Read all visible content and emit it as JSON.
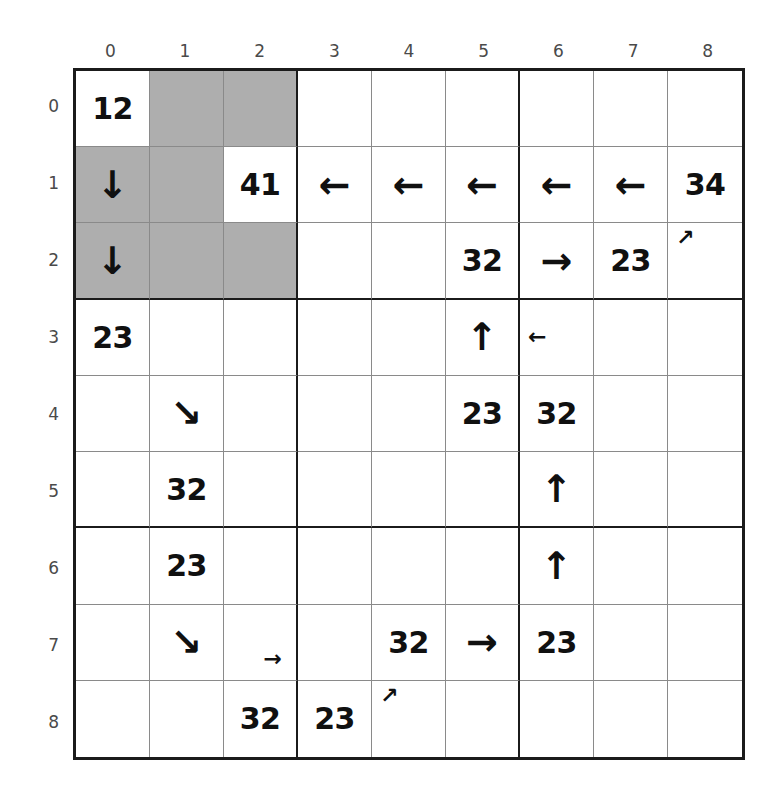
{
  "grid": {
    "rows": 9,
    "cols": 9,
    "col_labels": [
      "0",
      "1",
      "2",
      "3",
      "4",
      "5",
      "6",
      "7",
      "8"
    ],
    "row_labels": [
      "0",
      "1",
      "2",
      "3",
      "4",
      "5",
      "6",
      "7",
      "8"
    ],
    "block_size": 3,
    "colors": {
      "shaded_cell": "#aeaeae",
      "empty_cell": "#ffffff",
      "thin_line": "#8a8a8a",
      "thick_line": "#1b1b1b",
      "text": "#101010",
      "axis_label": "#4a4a4a"
    },
    "shaded_cells": [
      [
        0,
        1
      ],
      [
        0,
        2
      ],
      [
        1,
        0
      ],
      [
        1,
        1
      ],
      [
        2,
        0
      ],
      [
        2,
        1
      ],
      [
        2,
        2
      ]
    ],
    "cells": [
      [
        {
          "text": "12",
          "kind": "number"
        },
        {
          "text": "",
          "kind": "empty"
        },
        {
          "text": "",
          "kind": "empty"
        },
        {
          "text": "",
          "kind": "empty"
        },
        {
          "text": "",
          "kind": "empty"
        },
        {
          "text": "",
          "kind": "empty"
        },
        {
          "text": "",
          "kind": "empty"
        },
        {
          "text": "",
          "kind": "empty"
        },
        {
          "text": "",
          "kind": "empty"
        }
      ],
      [
        {
          "text": "↓",
          "kind": "arrow",
          "icon": "arrow-down-icon",
          "size": "big"
        },
        {
          "text": "",
          "kind": "empty"
        },
        {
          "text": "41",
          "kind": "number"
        },
        {
          "text": "←",
          "kind": "arrow",
          "icon": "arrow-left-icon",
          "size": "big"
        },
        {
          "text": "←",
          "kind": "arrow",
          "icon": "arrow-left-icon",
          "size": "big"
        },
        {
          "text": "←",
          "kind": "arrow",
          "icon": "arrow-left-icon",
          "size": "big"
        },
        {
          "text": "←",
          "kind": "arrow",
          "icon": "arrow-left-icon",
          "size": "big"
        },
        {
          "text": "←",
          "kind": "arrow",
          "icon": "arrow-left-icon",
          "size": "big"
        },
        {
          "text": "34",
          "kind": "number"
        }
      ],
      [
        {
          "text": "↓",
          "kind": "arrow",
          "icon": "arrow-down-icon",
          "size": "big"
        },
        {
          "text": "",
          "kind": "empty"
        },
        {
          "text": "",
          "kind": "empty"
        },
        {
          "text": "",
          "kind": "empty"
        },
        {
          "text": "",
          "kind": "empty"
        },
        {
          "text": "32",
          "kind": "number"
        },
        {
          "text": "→",
          "kind": "arrow",
          "icon": "arrow-right-icon",
          "size": "big"
        },
        {
          "text": "23",
          "kind": "number"
        },
        {
          "text": "↗",
          "kind": "arrow",
          "icon": "arrow-up-right-icon",
          "size": "small",
          "pos": "tl"
        }
      ],
      [
        {
          "text": "23",
          "kind": "number"
        },
        {
          "text": "",
          "kind": "empty"
        },
        {
          "text": "",
          "kind": "empty"
        },
        {
          "text": "",
          "kind": "empty"
        },
        {
          "text": "",
          "kind": "empty"
        },
        {
          "text": "↑",
          "kind": "arrow",
          "icon": "arrow-up-icon",
          "size": "big"
        },
        {
          "text": "←",
          "kind": "arrow",
          "icon": "arrow-left-icon",
          "size": "small",
          "pos": "l"
        },
        {
          "text": "",
          "kind": "empty"
        },
        {
          "text": "",
          "kind": "empty"
        }
      ],
      [
        {
          "text": "",
          "kind": "empty"
        },
        {
          "text": "↘",
          "kind": "arrow",
          "icon": "arrow-down-right-icon",
          "size": "big"
        },
        {
          "text": "",
          "kind": "empty"
        },
        {
          "text": "",
          "kind": "empty"
        },
        {
          "text": "",
          "kind": "empty"
        },
        {
          "text": "23",
          "kind": "number"
        },
        {
          "text": "32",
          "kind": "number"
        },
        {
          "text": "",
          "kind": "empty"
        },
        {
          "text": "",
          "kind": "empty"
        }
      ],
      [
        {
          "text": "",
          "kind": "empty"
        },
        {
          "text": "32",
          "kind": "number"
        },
        {
          "text": "",
          "kind": "empty"
        },
        {
          "text": "",
          "kind": "empty"
        },
        {
          "text": "",
          "kind": "empty"
        },
        {
          "text": "",
          "kind": "empty"
        },
        {
          "text": "↑",
          "kind": "arrow",
          "icon": "arrow-up-icon",
          "size": "big"
        },
        {
          "text": "",
          "kind": "empty"
        },
        {
          "text": "",
          "kind": "empty"
        }
      ],
      [
        {
          "text": "",
          "kind": "empty"
        },
        {
          "text": "23",
          "kind": "number"
        },
        {
          "text": "",
          "kind": "empty"
        },
        {
          "text": "",
          "kind": "empty"
        },
        {
          "text": "",
          "kind": "empty"
        },
        {
          "text": "",
          "kind": "empty"
        },
        {
          "text": "↑",
          "kind": "arrow",
          "icon": "arrow-up-icon",
          "size": "big"
        },
        {
          "text": "",
          "kind": "empty"
        },
        {
          "text": "",
          "kind": "empty"
        }
      ],
      [
        {
          "text": "",
          "kind": "empty"
        },
        {
          "text": "↘",
          "kind": "arrow",
          "icon": "arrow-down-right-icon",
          "size": "big"
        },
        {
          "text": "→",
          "kind": "arrow",
          "icon": "arrow-right-icon",
          "size": "small",
          "pos": "br"
        },
        {
          "text": "",
          "kind": "empty"
        },
        {
          "text": "32",
          "kind": "number"
        },
        {
          "text": "→",
          "kind": "arrow",
          "icon": "arrow-right-icon",
          "size": "big"
        },
        {
          "text": "23",
          "kind": "number"
        },
        {
          "text": "",
          "kind": "empty"
        },
        {
          "text": "",
          "kind": "empty"
        }
      ],
      [
        {
          "text": "",
          "kind": "empty"
        },
        {
          "text": "",
          "kind": "empty"
        },
        {
          "text": "32",
          "kind": "number"
        },
        {
          "text": "23",
          "kind": "number"
        },
        {
          "text": "↗",
          "kind": "arrow",
          "icon": "arrow-up-right-icon",
          "size": "small",
          "pos": "tl"
        },
        {
          "text": "",
          "kind": "empty"
        },
        {
          "text": "",
          "kind": "empty"
        },
        {
          "text": "",
          "kind": "empty"
        },
        {
          "text": "",
          "kind": "empty"
        }
      ]
    ]
  }
}
